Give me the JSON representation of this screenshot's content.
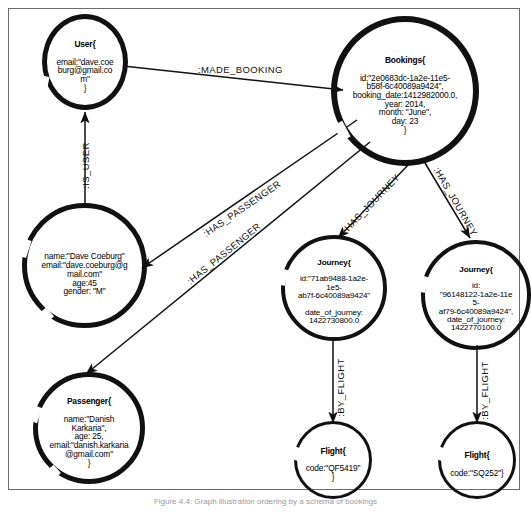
{
  "figure": {
    "caption": "Figure 4.4: Graph illustration ordering by a schema of bookings",
    "caption_visible_note": "clipped at image bottom edge"
  },
  "graph": {
    "type": "property-graph-diagram",
    "nodes": [
      {
        "id": "user",
        "name": "user-node",
        "header": "User{",
        "lines": [
          "email:\"dave.coe",
          "burg@gmail.co",
          "m\"",
          "}"
        ],
        "stroke": "thick"
      },
      {
        "id": "bookings",
        "name": "bookings-node",
        "header": "Bookings{",
        "lines": [
          "id:\"2e0683dc-1a2e-11e5-",
          "b58f-6c40089a9424\",",
          "booking_date:1412982000.0,",
          "year: 2014,",
          "month: \"June\",",
          "day: 23",
          "}"
        ],
        "stroke": "thick"
      },
      {
        "id": "dave",
        "name": "dave-coeburg-person-node",
        "header": "",
        "lines": [
          "name:\"Dave Coeburg\"",
          "email:\"dave.coeburg@g",
          "mail.com\"",
          "age:45",
          "gender: \"M\""
        ],
        "stroke": "thick"
      },
      {
        "id": "passenger",
        "name": "passenger-node",
        "header": "Passenger{",
        "lines": [
          "name:\"Danish",
          "Karkaria\",",
          "age: 25,",
          "email:\"danish.karkaria",
          "@gmail.com\"",
          "}"
        ],
        "stroke": "thick"
      },
      {
        "id": "journey1",
        "name": "journey-node-left",
        "header": "Journey{",
        "lines": [
          "id:\"71ab9488-1a2e-",
          "1e5-",
          "ab7f-6c40089a9424\"",
          "",
          "date_of_journey:",
          "1422730800.0"
        ],
        "stroke": "thick"
      },
      {
        "id": "journey2",
        "name": "journey-node-right",
        "header": "Journey{",
        "lines": [
          "id:",
          "\"96148122-1a2e-11e",
          "5-",
          "af79-6c40089a9424\",",
          "date_of_journey:",
          "1422770100.0"
        ],
        "stroke": "thick"
      },
      {
        "id": "flight1",
        "name": "flight-node-left",
        "header": "Flight{",
        "lines": [
          "code:\"QF5419\"",
          "}"
        ],
        "stroke": "thin"
      },
      {
        "id": "flight2",
        "name": "flight-node-right",
        "header": "Flight{",
        "lines": [
          "code:\"SQ252\"}"
        ],
        "stroke": "thin"
      }
    ],
    "edges": [
      {
        "id": "e1",
        "name": "edge-made-booking",
        "label": ":MADE_BOOKING",
        "from": "user",
        "to": "bookings"
      },
      {
        "id": "e2",
        "name": "edge-is-user",
        "label": ":IS_USER",
        "from": "dave",
        "to": "user"
      },
      {
        "id": "e3",
        "name": "edge-has-passenger-dave",
        "label": ":HAS_PASSENGER",
        "from": "bookings",
        "to": "dave"
      },
      {
        "id": "e4",
        "name": "edge-has-passenger-danish",
        "label": ":HAS_PASSENGER",
        "from": "bookings",
        "to": "passenger"
      },
      {
        "id": "e5",
        "name": "edge-has-journey-left",
        "label": ":HAS_JOURNEY",
        "from": "bookings",
        "to": "journey1"
      },
      {
        "id": "e6",
        "name": "edge-has-journey-right",
        "label": ":HAS_JOURNEY",
        "from": "bookings",
        "to": "journey2"
      },
      {
        "id": "e7",
        "name": "edge-by-flight-left",
        "label": ":BY_FLIGHT",
        "from": "journey1",
        "to": "flight1"
      },
      {
        "id": "e8",
        "name": "edge-by-flight-right",
        "label": ":BY_FLIGHT",
        "from": "journey2",
        "to": "flight2"
      }
    ]
  },
  "colors": {
    "stroke": "#111111",
    "frame": "#6b6b6b",
    "background": "#ffffff",
    "caption": "#9a9a9a"
  }
}
